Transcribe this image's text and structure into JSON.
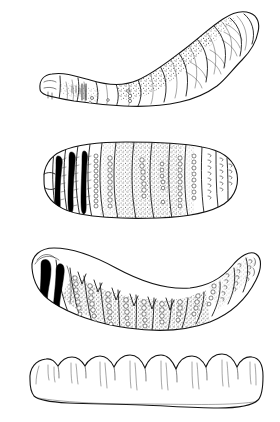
{
  "plate": {
    "title": "Fly larva (bot fly grub) morphology plate",
    "background_color": "#ffffff",
    "ink_color": "#1a1a1a",
    "width_px": 280,
    "height_px": 422,
    "figure_count": 4,
    "technique": "pen-and-ink line drawing with stipple shading",
    "labels_present": "none"
  },
  "figures": [
    {
      "index": "1",
      "name": "lateral-view-larva",
      "view": "lateral",
      "description": "Curved larva in side view, anterior to the left, posterior spiracular plate at upper right",
      "bbox": {
        "x": 36,
        "y": 8,
        "width": 232,
        "height": 106
      },
      "orientation": "arched upward to the right",
      "features": "segmented body, stippled shading on mid segments, overlapping posterior segments",
      "shading": "stipple"
    },
    {
      "index": "2",
      "name": "ventral-view-larva-straight",
      "view": "ventral",
      "description": "Straight broad larva showing segment bands with dark spine patches at anterior left and hook rows at posterior right",
      "bbox": {
        "x": 42,
        "y": 142,
        "width": 196,
        "height": 72
      },
      "orientation": "horizontal",
      "features": "three solid black spine bands, chains of circular spines, stippled mid segments",
      "shading": "stipple and solid black"
    },
    {
      "index": "3",
      "name": "ventral-view-larva-curved",
      "view": "ventral",
      "description": "Curved larva with dark mouth-hook area at left, V-notched stippled segments, and posterior end curving upward at right",
      "bbox": {
        "x": 26,
        "y": 245,
        "width": 232,
        "height": 88
      },
      "orientation": "crescent, concave upward",
      "features": "solid black cephalopharyngeal spine blobs, rows of bead-like spines, stippled venter",
      "shading": "stipple and solid black"
    },
    {
      "index": "4",
      "name": "outline-view-larva",
      "view": "outline / profile",
      "description": "Plain outline of the larva with scalloped lobed dorsal margin and smooth undulating ventral margin",
      "bbox": {
        "x": 26,
        "y": 352,
        "width": 232,
        "height": 60
      },
      "orientation": "horizontal",
      "features": "unshaded contour drawing, nine dorsal lobes, short internal hair lines",
      "shading": "none"
    }
  ]
}
